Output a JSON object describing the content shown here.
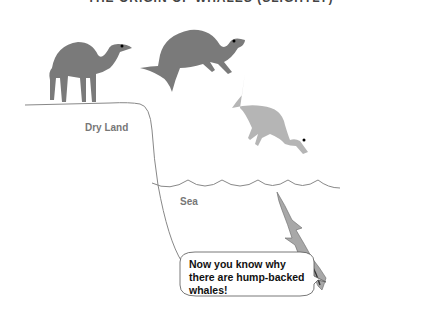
{
  "title": "THE ORIGIN OF WHALES (SLIGHTLY)",
  "labels": {
    "land": "Dry Land",
    "sea": "Sea"
  },
  "speech_bubble": {
    "line1": "Now you know why",
    "line2": "there are hump-backed",
    "line3": "whales!"
  },
  "figures": [
    {
      "name": "camel-standing",
      "color": "#7a7a7a"
    },
    {
      "name": "camel-leaping",
      "color": "#7a7a7a"
    },
    {
      "name": "camel-diving",
      "color": "#b5b5b5"
    },
    {
      "name": "humpback-whale",
      "color": "#a8a8a8"
    }
  ],
  "colors": {
    "line": "#888888",
    "text": "#111111"
  }
}
